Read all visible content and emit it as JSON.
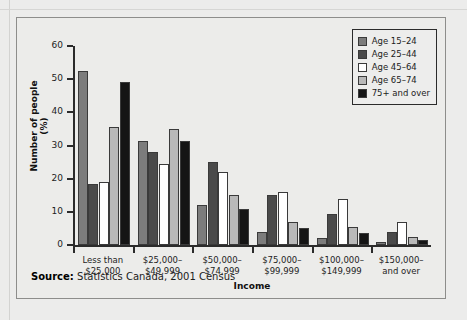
{
  "panel": {
    "source_label": "Source:",
    "source_text": "Statistics Canada, 2001 Census"
  },
  "legend": {
    "position": "top-right",
    "items": [
      {
        "label": "Age 15–24",
        "color": "#7c7c7c"
      },
      {
        "label": "Age 25–44",
        "color": "#4a4a4a"
      },
      {
        "label": "Age 45–64",
        "color": "#ffffff"
      },
      {
        "label": "Age 65–74",
        "color": "#b9b9b9"
      },
      {
        "label": "75+ and over",
        "color": "#151515"
      }
    ]
  },
  "chart_data": {
    "type": "bar",
    "title": "",
    "xlabel": "Income",
    "ylabel": "Number of people (%)",
    "ylim": [
      0,
      60
    ],
    "yticks": [
      0,
      10,
      20,
      30,
      40,
      50,
      60
    ],
    "grid": false,
    "categories": [
      "Less than\n$25,000",
      "$25,000–\n$49,999",
      "$50,000–\n$74,999",
      "$75,000–\n$99,999",
      "$100,000–\n$149,999",
      "$150,000–\nand over"
    ],
    "category_lines": [
      [
        "Less than",
        "$25,000"
      ],
      [
        "$25,000–",
        "$49,999"
      ],
      [
        "$50,000–",
        "$74,999"
      ],
      [
        "$75,000–",
        "$99,999"
      ],
      [
        "$100,000–",
        "$149,999"
      ],
      [
        "$150,000–",
        "and over"
      ]
    ],
    "series": [
      {
        "name": "Age 15–24",
        "color": "#7c7c7c",
        "values": [
          52.5,
          31.5,
          12.0,
          4.0,
          2.0,
          1.0
        ]
      },
      {
        "name": "Age 25–44",
        "color": "#4a4a4a",
        "values": [
          18.5,
          28.0,
          25.0,
          15.0,
          9.5,
          4.0
        ]
      },
      {
        "name": "Age 45–64",
        "color": "#ffffff",
        "values": [
          19.0,
          24.5,
          22.0,
          16.0,
          14.0,
          7.0
        ]
      },
      {
        "name": "Age 65–74",
        "color": "#b9b9b9",
        "values": [
          35.5,
          35.0,
          15.0,
          7.0,
          5.5,
          2.5
        ]
      },
      {
        "name": "75+ and over",
        "color": "#151515",
        "values": [
          49.0,
          31.5,
          11.0,
          5.0,
          3.5,
          1.5
        ]
      }
    ]
  }
}
